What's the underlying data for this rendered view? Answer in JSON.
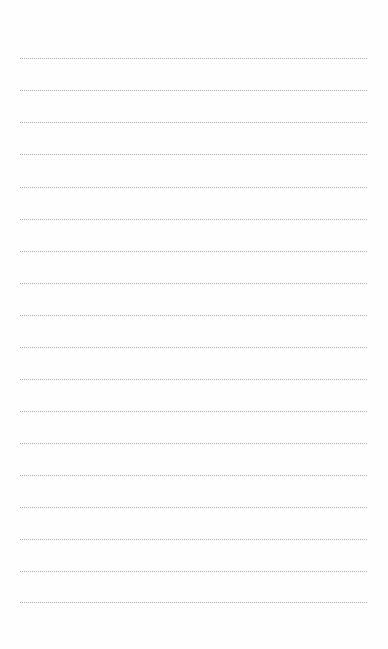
{
  "page": {
    "type": "lined-paper",
    "background_color": "#fefefe",
    "rule_color": "#aeaeae",
    "rule_style": "dotted",
    "rule_left": 20,
    "rule_right": 367,
    "rules_y": [
      58,
      90,
      122,
      154,
      187,
      219,
      251,
      283,
      315,
      347,
      379,
      411,
      443,
      475,
      507,
      539,
      571,
      602
    ]
  }
}
